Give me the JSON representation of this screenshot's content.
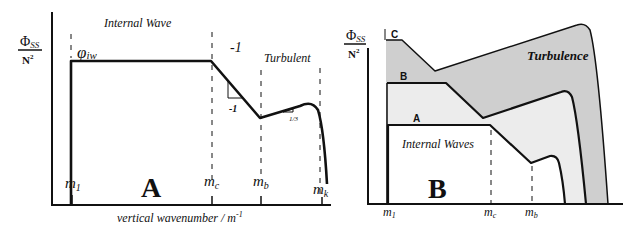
{
  "panel_a": {
    "letter": "A",
    "y_label_num": "Φ",
    "y_label_sub": "SS",
    "y_label_den": "N",
    "y_label_den_sup": "2",
    "region_internal_wave": "Internal Wave",
    "region_turbulent": "Turbulent",
    "phi_label": "φ",
    "phi_sub": "iw",
    "slope_top": "-1",
    "slope_triangle": "-1",
    "slope_third": "1/3",
    "ticks": [
      {
        "m": "m",
        "sub": "1"
      },
      {
        "m": "m",
        "sub": "c"
      },
      {
        "m": "m",
        "sub": "b"
      },
      {
        "m": "m",
        "sub": "k"
      }
    ],
    "x_label": "vertical wavenumber / m",
    "x_label_sup": "-1"
  },
  "panel_b": {
    "letter": "B",
    "y_label_num": "Φ",
    "y_label_sub": "SS",
    "y_label_den": "N",
    "y_label_den_sup": "2",
    "curve_labels": [
      "A",
      "B",
      "C"
    ],
    "region_internal_waves": "Internal Waves",
    "region_turbulence": "Turbulence",
    "ticks": [
      {
        "m": "m",
        "sub": "1"
      },
      {
        "m": "m",
        "sub": "c"
      },
      {
        "m": "m",
        "sub": "b"
      }
    ]
  },
  "colors": {
    "line": "#111111",
    "shade_dark": "#cfcfcf",
    "shade_light": "#ececec",
    "background": "#ffffff"
  }
}
